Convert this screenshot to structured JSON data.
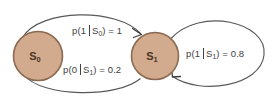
{
  "diagram": {
    "type": "markov-state-transition-diagram",
    "background_color": "#ffffff",
    "node_fill_color": "#d2aa8d",
    "node_border_color": "#8b6a51",
    "edge_color": "#58585a",
    "label_color": "#414143",
    "nodes": [
      {
        "id": "S0",
        "label_base": "S",
        "label_sub": "0",
        "cx": 38,
        "cy": 56,
        "r": 24.5
      },
      {
        "id": "S1",
        "label_base": "S",
        "label_sub": "1",
        "cx": 155,
        "cy": 56,
        "r": 23.5
      }
    ],
    "edges": [
      {
        "id": "s0-to-s1",
        "from": "S0",
        "to": "S1",
        "position": "top",
        "prob_prefix": "p(1",
        "prob_condition": "S",
        "prob_condition_sub": "0",
        "prob_suffix": ") = 1",
        "value": 1
      },
      {
        "id": "s1-to-s0",
        "from": "S1",
        "to": "S0",
        "position": "bottom",
        "prob_prefix": "p(0",
        "prob_condition": "S",
        "prob_condition_sub": "1",
        "prob_suffix": ") = 0.2",
        "value": 0.2
      },
      {
        "id": "s1-self-loop",
        "from": "S1",
        "to": "S1",
        "position": "right",
        "prob_prefix": "p(1",
        "prob_condition": "S",
        "prob_condition_sub": "1",
        "prob_suffix": ") = 0.8",
        "value": 0.8
      }
    ]
  }
}
